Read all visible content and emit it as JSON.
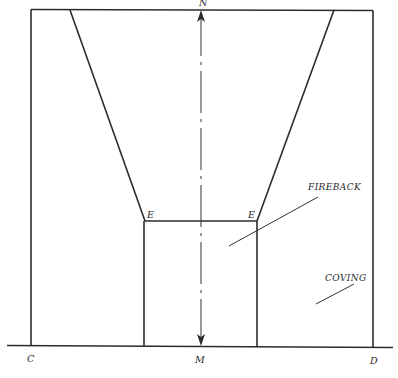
{
  "diagram": {
    "colors": {
      "line": "#2b2b2b",
      "text": "#2a2a2a",
      "background": "#ffffff"
    },
    "labels": {
      "top_center": "N",
      "bottom_center": "M",
      "bottom_left": "C",
      "bottom_right": "D",
      "corner_left": "E",
      "corner_right": "E",
      "fireback": "FIREBACK",
      "coving": "COVING"
    },
    "annotations": [
      {
        "text": "FIREBACK",
        "leader": true,
        "points_to": "fireback panel"
      },
      {
        "text": "COVING",
        "leader": true,
        "points_to": "coving area"
      }
    ],
    "axis": {
      "from": "M",
      "to": "N",
      "style": "dash-dot",
      "arrows": "both ends"
    }
  }
}
